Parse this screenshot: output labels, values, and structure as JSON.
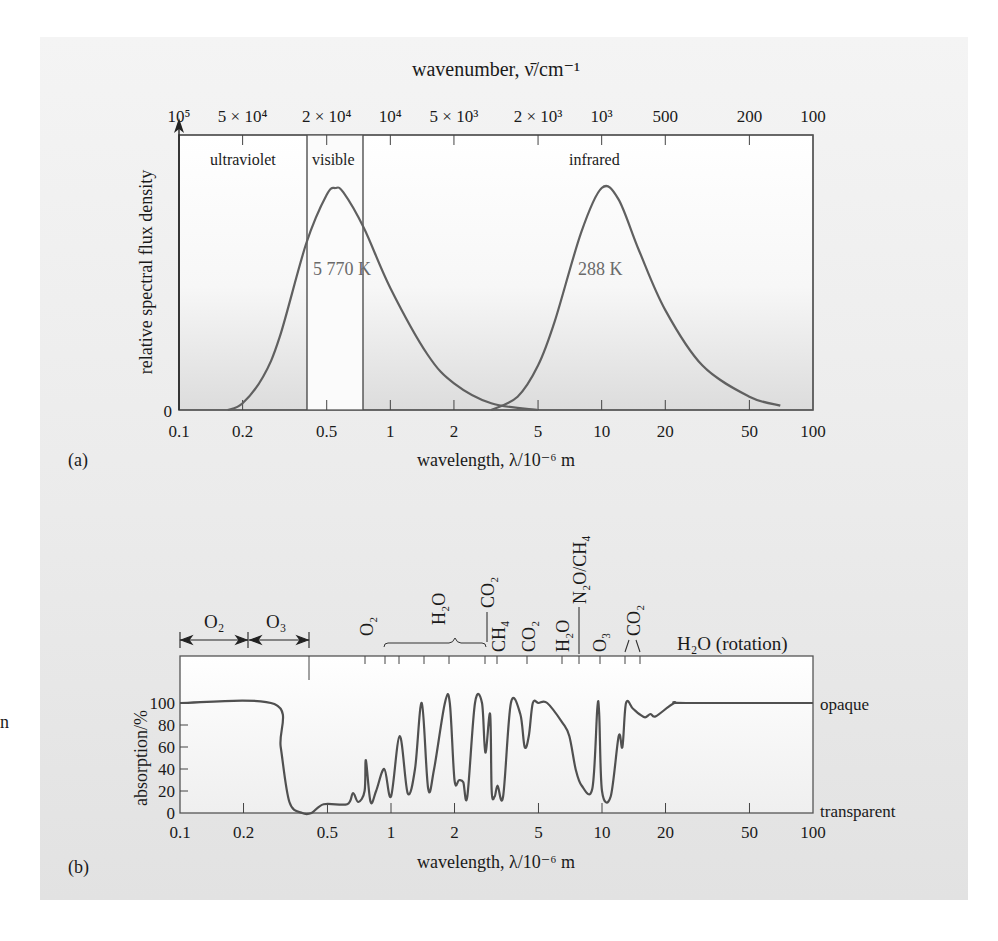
{
  "figure": {
    "panel_a_label": "(a)",
    "panel_b_label": "(b)",
    "stray_margin_text": "n"
  },
  "chart_data": [
    {
      "type": "line",
      "panel": "(a)",
      "title": "",
      "top_axis_label": "wavenumber, ν̄/cm⁻¹",
      "top_axis_ticks": [
        "10⁵",
        "5 × 10⁴",
        "2 × 10⁴",
        "10⁴",
        "5 × 10³",
        "2 × 10³",
        "10³",
        "500",
        "200",
        "100"
      ],
      "xlabel": "wavelength, λ/10⁻⁶ m",
      "ylabel": "relative spectral flux density",
      "x_scale": "log",
      "xlim": [
        0.1,
        100
      ],
      "x_ticks": [
        "0.1",
        "0.2",
        "0.5",
        "1",
        "2",
        "5",
        "10",
        "20",
        "50",
        "100"
      ],
      "y_ticks": [
        "0"
      ],
      "regions": [
        {
          "label": "ultraviolet",
          "from": 0.1,
          "to": 0.4
        },
        {
          "label": "visible",
          "from": 0.4,
          "to": 0.75
        },
        {
          "label": "infrared",
          "from": 0.75,
          "to": 100
        }
      ],
      "series": [
        {
          "name": "5 770 K",
          "note": "solar blackbody, normalised",
          "peak_wavelength": 0.55,
          "x": [
            0.17,
            0.2,
            0.25,
            0.3,
            0.4,
            0.5,
            0.55,
            0.6,
            0.75,
            1,
            1.5,
            2,
            3,
            5
          ],
          "y": [
            0.0,
            0.03,
            0.15,
            0.33,
            0.75,
            0.97,
            1.0,
            0.98,
            0.82,
            0.55,
            0.25,
            0.12,
            0.03,
            0.0
          ]
        },
        {
          "name": "288 K",
          "note": "terrestrial blackbody, normalised",
          "peak_wavelength": 10,
          "x": [
            3,
            4,
            5,
            6,
            8,
            10,
            12,
            15,
            20,
            30,
            50,
            70
          ],
          "y": [
            0.0,
            0.06,
            0.2,
            0.4,
            0.8,
            1.0,
            0.95,
            0.72,
            0.45,
            0.2,
            0.06,
            0.02
          ]
        }
      ],
      "annotations": [
        "ultraviolet",
        "visible",
        "infrared",
        "5 770 K",
        "288 K"
      ]
    },
    {
      "type": "line",
      "panel": "(b)",
      "title": "",
      "xlabel": "wavelength, λ/10⁻⁶ m",
      "ylabel": "absorption/%",
      "x_scale": "log",
      "xlim": [
        0.1,
        100
      ],
      "ylim": [
        0,
        100
      ],
      "x_ticks": [
        "0.1",
        "0.2",
        "0.5",
        "1",
        "2",
        "5",
        "10",
        "20",
        "50",
        "100"
      ],
      "y_ticks": [
        "0",
        "20",
        "40",
        "60",
        "80",
        "100"
      ],
      "right_labels": {
        "top": "opaque",
        "bottom": "transparent"
      },
      "absorber_labels": [
        {
          "label": "O₂",
          "type": "range",
          "from": 0.1,
          "to": 0.21
        },
        {
          "label": "O₃",
          "type": "range",
          "from": 0.21,
          "to": 0.41
        },
        {
          "label": "O₂",
          "at": 0.76
        },
        {
          "label": "H₂O",
          "type": "brace",
          "from": 0.94,
          "to": 2.7
        },
        {
          "label": "CO₂",
          "at": 2.7
        },
        {
          "label": "CH₄",
          "at": 3.3
        },
        {
          "label": "CO₂",
          "at": 4.3
        },
        {
          "label": "H₂O",
          "at": 6.3
        },
        {
          "label": "N₂O/CH₄",
          "at": 7.7
        },
        {
          "label": "O₃",
          "at": 9.6
        },
        {
          "label": "CO₂",
          "at": 15
        },
        {
          "label": "H₂O (rotation)",
          "from": 20,
          "to": 100
        }
      ],
      "series": [
        {
          "name": "atmospheric absorption",
          "x": [
            0.1,
            0.28,
            0.3,
            0.33,
            0.38,
            0.42,
            0.48,
            0.62,
            0.66,
            0.7,
            0.75,
            0.76,
            0.8,
            0.85,
            0.93,
            1.0,
            1.1,
            1.2,
            1.3,
            1.4,
            1.5,
            1.6,
            1.8,
            1.9,
            2.0,
            2.1,
            2.2,
            2.3,
            2.5,
            2.7,
            2.8,
            2.95,
            3.0,
            3.1,
            3.2,
            3.4,
            3.7,
            4.1,
            4.3,
            4.5,
            4.7,
            5.0,
            5.5,
            6.5,
            7.0,
            7.5,
            8.0,
            9.0,
            9.5,
            9.7,
            10.0,
            11.0,
            12.0,
            12.5,
            13.0,
            14.0,
            15.0,
            16.0,
            17.0,
            18.0,
            22.0,
            25.0,
            100.0
          ],
          "y": [
            100,
            99,
            60,
            10,
            0,
            0,
            8,
            8,
            18,
            10,
            20,
            48,
            10,
            20,
            40,
            15,
            70,
            18,
            40,
            100,
            22,
            40,
            100,
            100,
            30,
            30,
            28,
            15,
            100,
            100,
            55,
            90,
            20,
            15,
            25,
            15,
            100,
            90,
            60,
            70,
            100,
            100,
            100,
            82,
            70,
            40,
            25,
            22,
            95,
            90,
            20,
            15,
            70,
            60,
            100,
            95,
            90,
            87,
            90,
            88,
            100,
            100,
            100
          ]
        }
      ]
    }
  ]
}
